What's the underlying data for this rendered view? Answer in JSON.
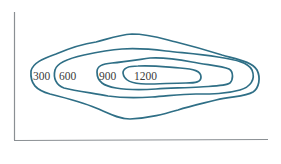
{
  "diagram": {
    "type": "topographic-contour-map",
    "contour_color": "#2f6f86",
    "axis_color": "#8a8f93",
    "contours": [
      {
        "elevation": 300,
        "label": "300"
      },
      {
        "elevation": 600,
        "label": "600"
      },
      {
        "elevation": 900,
        "label": "900"
      },
      {
        "elevation": 1200,
        "label": "1200"
      }
    ]
  }
}
